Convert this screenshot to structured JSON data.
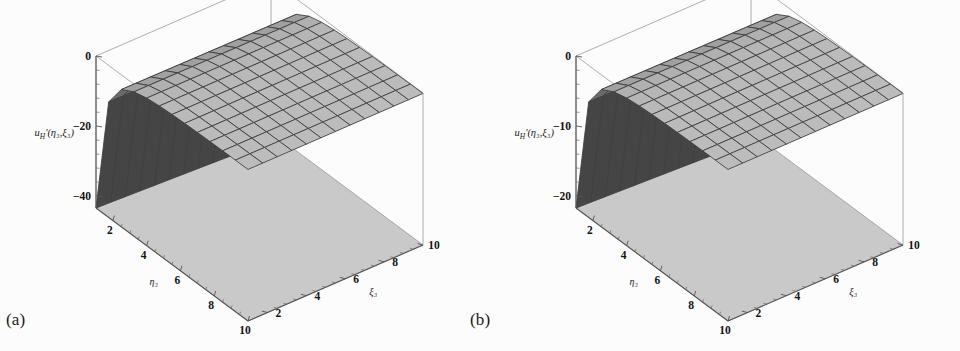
{
  "figure": {
    "background_color": "#fcfcfc",
    "panel_count": 2
  },
  "panels": [
    {
      "caption": "(a)",
      "vertical_label": "u",
      "vertical_label_sub": "H",
      "vertical_label_prime": "'",
      "vertical_label_args": "(η₃,ξ₃)",
      "vertical_ticks": [
        "0",
        "−20",
        "−40"
      ],
      "vertical_tick_values": [
        0,
        -20,
        -40
      ],
      "eta_label": "η₃",
      "eta_ticks": [
        "2",
        "4",
        "6",
        "8",
        "10"
      ],
      "xi_label": "ξ₃",
      "xi_ticks": [
        "2",
        "4",
        "6",
        "8",
        "10"
      ]
    },
    {
      "caption": "(b)",
      "vertical_label": "u",
      "vertical_label_sub": "H",
      "vertical_label_prime": "'",
      "vertical_label_args": "(η₃,ξ₃)",
      "vertical_ticks": [
        "0",
        "−10",
        "−20"
      ],
      "vertical_tick_values": [
        0,
        -10,
        -20
      ],
      "eta_label": "η₃",
      "eta_ticks": [
        "2",
        "4",
        "6",
        "8",
        "10"
      ],
      "xi_label": "ξ₃",
      "xi_ticks": [
        "2",
        "4",
        "6",
        "8",
        "10"
      ]
    }
  ],
  "chart_data": {
    "type": "surface",
    "plot_count": 2,
    "title": "",
    "xlabel": "η₃",
    "ylabel": "ξ₃",
    "zlabel": "u_H'(η₃,ξ₃)",
    "xlim": [
      1,
      10
    ],
    "ylim": [
      1,
      10
    ],
    "grid": true,
    "mesh_nx": 13,
    "mesh_ny": 13,
    "legend": "none",
    "surface_fill": "#b2b2b2",
    "surface_mesh_color": "#3d3d3d",
    "base_plane_fill": "#c9c9c9",
    "frame_color": "#9a9a9a",
    "plots": [
      {
        "name": "(a)",
        "zlim": [
          -48,
          0
        ],
        "z_ticks": [
          0,
          -20,
          -40
        ],
        "description": "Surface u_H'(η₃,ξ₃) descending steeply to about −48 near η₃≈1, flattening toward η₃=10; nearly independent of ξ₃",
        "z_at_eta_min": -48,
        "z_at_eta_max": -2,
        "z_scale_amplitude": 48
      },
      {
        "name": "(b)",
        "zlim": [
          -24,
          0
        ],
        "z_ticks": [
          0,
          -10,
          -20
        ],
        "description": "Same qualitative surface shape with half the vertical amplitude, descending to about −24 near η₃≈1",
        "z_at_eta_min": -24,
        "z_at_eta_max": -1,
        "z_scale_amplitude": 24
      }
    ]
  }
}
